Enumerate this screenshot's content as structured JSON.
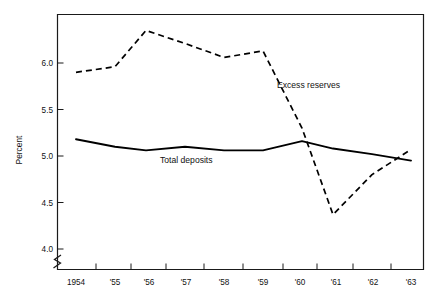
{
  "chart_data": {
    "type": "line",
    "title": "",
    "xlabel": "",
    "ylabel": "Percent",
    "x": [
      "1954",
      "1955",
      "1956",
      "1957",
      "1958",
      "1959",
      "1960",
      "1961",
      "1962",
      "1963"
    ],
    "categories": [
      "1954",
      "'55",
      "'56",
      "'57",
      "'58",
      "'59",
      "'60",
      "'61",
      "'62",
      "'63"
    ],
    "series": [
      {
        "name": "Excess reserves",
        "style": "dashed",
        "color": "#000000",
        "values": [
          5.9,
          5.96,
          6.35,
          6.21,
          6.06,
          6.13,
          5.3,
          4.37,
          4.8,
          5.07
        ]
      },
      {
        "name": "Total deposits",
        "style": "solid",
        "color": "#000000",
        "values": [
          5.18,
          5.1,
          5.06,
          5.1,
          5.06,
          5.06,
          5.16,
          5.08,
          5.02,
          4.95
        ]
      }
    ],
    "ylim": [
      3.78,
      6.48
    ],
    "yticks": [
      4.0,
      4.5,
      5.0,
      5.5,
      6.0
    ],
    "ytick_labels": [
      "4.0",
      "4.5",
      "5.0",
      "5.5",
      "6.0"
    ],
    "grid": false,
    "legend": "inline-annotations",
    "y_axis_break": true,
    "annotations": [
      {
        "text": "Excess reserves",
        "x": 1960.2,
        "y": 5.72
      },
      {
        "text": "Total deposits",
        "x": 1957.2,
        "y": 4.9
      }
    ]
  },
  "axes": {
    "y_title": "Percent",
    "y_tick_labels": [
      "6.0",
      "5.5",
      "5.0",
      "4.5",
      "4.0"
    ],
    "x_tick_labels": [
      "1954",
      "'55",
      "'56",
      "'57",
      "'58",
      "'59",
      "'60",
      "'61",
      "'62",
      "'63"
    ]
  },
  "labels": {
    "excess_reserves": "Excess reserves",
    "total_deposits": "Total deposits"
  }
}
